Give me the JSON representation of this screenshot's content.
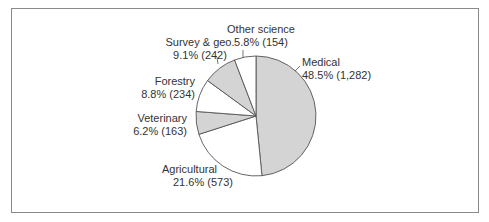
{
  "chart_data": {
    "type": "pie",
    "title": "",
    "categories": [
      "Medical",
      "Agricultural",
      "Veterinary",
      "Forestry",
      "Survey & geo.",
      "Other science"
    ],
    "values": [
      1282,
      573,
      163,
      234,
      242,
      154
    ],
    "percentages": [
      48.5,
      21.6,
      6.2,
      8.8,
      9.1,
      5.8
    ],
    "start_angle": "12 o'clock",
    "direction": "clockwise",
    "fills": [
      "#d4d4d4",
      "#ffffff",
      "#d4d4d4",
      "#ffffff",
      "#d4d4d4",
      "#ffffff"
    ],
    "stroke": "#555555",
    "legend": "none (direct labels)"
  },
  "labels": {
    "medical": {
      "name": "Medical",
      "value": "48.5%  (1,282)"
    },
    "agricultural": {
      "name": "Agricultural",
      "value": "21.6%  (573)"
    },
    "veterinary": {
      "name": "Veterinary",
      "value": "6.2%  (163)"
    },
    "forestry": {
      "name": "Forestry",
      "value": "8.8%  (234)"
    },
    "survey": {
      "name": "Survey & geo.",
      "value": "9.1%  (242)"
    },
    "other": {
      "name": "Other science",
      "value": "5.8% (154)"
    }
  }
}
